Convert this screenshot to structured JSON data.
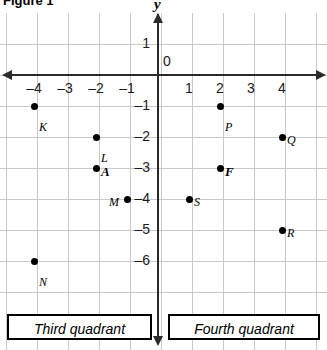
{
  "figure": {
    "title": "Figure 1"
  },
  "axes": {
    "y_axis_label": "y",
    "origin_label": "0",
    "x_ticks": [
      {
        "value": -4,
        "label": "–4"
      },
      {
        "value": -3,
        "label": "–3"
      },
      {
        "value": -2,
        "label": "–2"
      },
      {
        "value": -1,
        "label": "–1"
      },
      {
        "value": 1,
        "label": "1"
      },
      {
        "value": 2,
        "label": "2"
      },
      {
        "value": 3,
        "label": "3"
      },
      {
        "value": 4,
        "label": "4"
      }
    ],
    "y_ticks": [
      {
        "value": 1,
        "label": "1"
      },
      {
        "value": -1,
        "label": "–1"
      },
      {
        "value": -2,
        "label": "–2"
      },
      {
        "value": -3,
        "label": "–3"
      },
      {
        "value": -4,
        "label": "–4"
      },
      {
        "value": -5,
        "label": "–5"
      },
      {
        "value": -6,
        "label": "–6"
      }
    ]
  },
  "chart_data": {
    "type": "scatter",
    "title": "Figure 1",
    "xlabel": "",
    "ylabel": "y",
    "xlim": [
      -5,
      5
    ],
    "ylim": [
      -7,
      1.5
    ],
    "grid": true,
    "legend": "none",
    "points": [
      {
        "label": "K",
        "x": -4,
        "y": -1,
        "bold": false,
        "label_dx": 5,
        "label_dy": 14
      },
      {
        "label": "L",
        "x": -2,
        "y": -2,
        "bold": false,
        "label_dx": 5,
        "label_dy": 14
      },
      {
        "label": "A",
        "x": -2,
        "y": -3,
        "bold": true,
        "label_dx": 5,
        "label_dy": -4
      },
      {
        "label": "M",
        "x": -1,
        "y": -4,
        "bold": false,
        "label_dx": -18,
        "label_dy": -4
      },
      {
        "label": "N",
        "x": -4,
        "y": -6,
        "bold": false,
        "label_dx": 5,
        "label_dy": 14
      },
      {
        "label": "P",
        "x": 2,
        "y": -1,
        "bold": false,
        "label_dx": 5,
        "label_dy": 14
      },
      {
        "label": "Q",
        "x": 4,
        "y": -2,
        "bold": false,
        "label_dx": 5,
        "label_dy": -4
      },
      {
        "label": "F",
        "x": 2,
        "y": -3,
        "bold": true,
        "label_dx": 5,
        "label_dy": -4
      },
      {
        "label": "S",
        "x": 1,
        "y": -4,
        "bold": false,
        "label_dx": 5,
        "label_dy": -4
      },
      {
        "label": "R",
        "x": 4,
        "y": -5,
        "bold": false,
        "label_dx": 5,
        "label_dy": -4
      }
    ]
  },
  "captions": {
    "third_quadrant": "Third quadrant",
    "fourth_quadrant": "Fourth quadrant"
  },
  "colors": {
    "axis": "#2b2b2b",
    "grid": "#c9c9c9",
    "point": "#000000",
    "text": "#000000",
    "background": "#ffffff"
  }
}
